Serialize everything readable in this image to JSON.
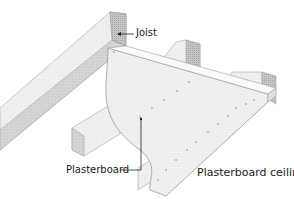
{
  "diagram": {
    "title": "Plasterboard ceiling",
    "labels": {
      "joist": "Joist",
      "plasterboard": "Plasterboard",
      "ceiling": "Plasterboard ceiling"
    },
    "colors": {
      "joist_top": "#e6e6e6",
      "joist_side": "#d2d2d2",
      "joist_end": "#bdbdbd",
      "board_face": "#efefef",
      "board_edge": "#f8f8f8",
      "outline": "#9a9a9a",
      "leader": "#222222",
      "nail": "#b5b5b5"
    }
  }
}
